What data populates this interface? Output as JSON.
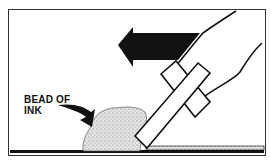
{
  "diagram": {
    "label_line1": "BEAD OF",
    "label_line2": "INK",
    "direction": "left",
    "colors": {
      "ink_fill": "#dcdcdc",
      "stroke": "#111111",
      "background": "#ffffff"
    }
  }
}
